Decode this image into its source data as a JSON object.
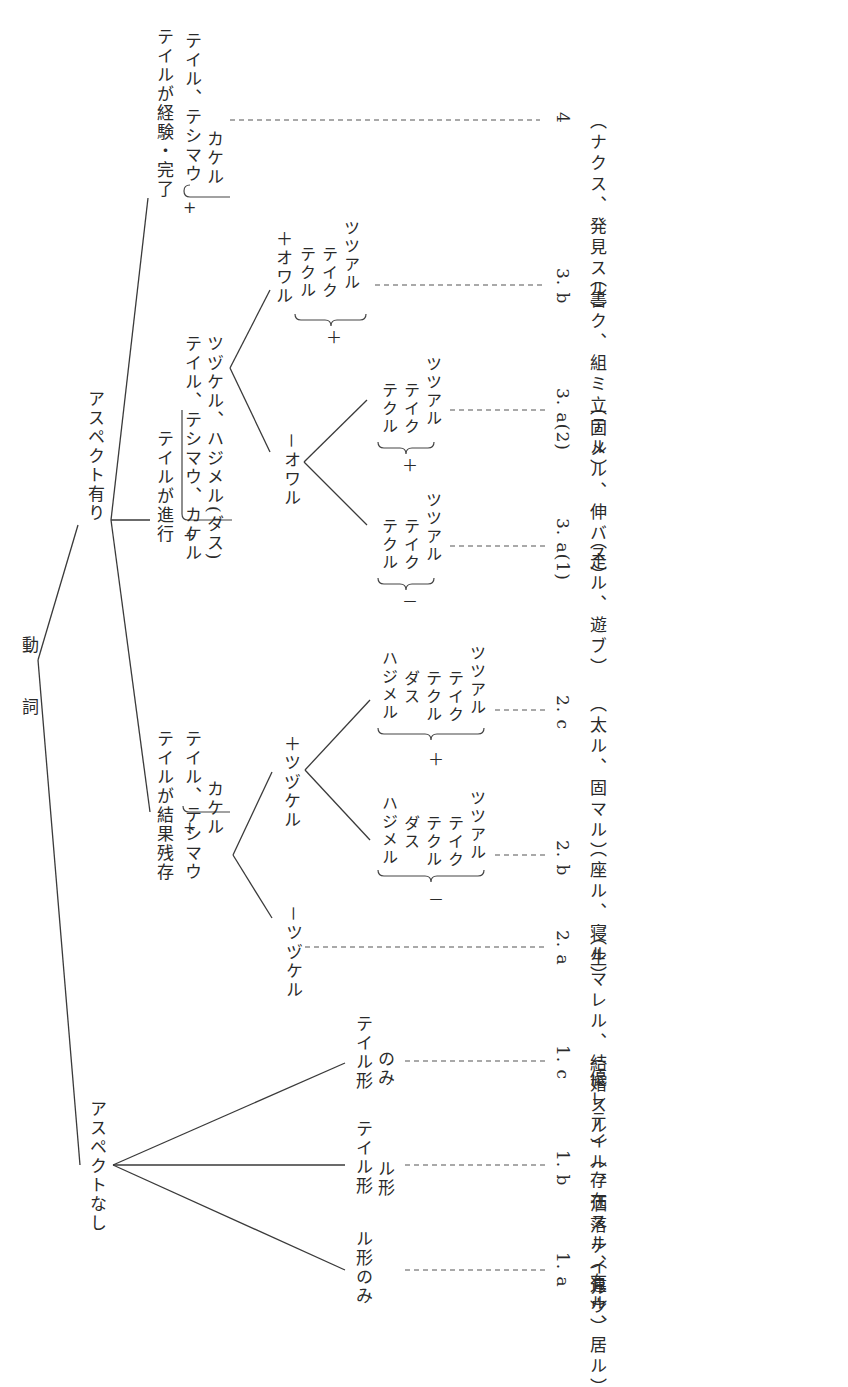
{
  "diagram": {
    "orientation": "rotated 90° clockwise; text reads top-to-bottom",
    "root": "動　詞",
    "aspect_none": {
      "label": "アスペクトなし",
      "children": [
        {
          "label": "ル形のみ",
          "code": "1. a",
          "examples": "（有ル、居ル）"
        },
        {
          "label_line1": "テイル形",
          "label_line2": "ル形",
          "code": "1. b",
          "examples": "（存在スル、違ウ）"
        },
        {
          "label_line1": "テイル形",
          "label_line2": "のみ",
          "code": "1. c",
          "examples": "（優レテイル、洒落テイル）"
        }
      ]
    },
    "aspect_present": {
      "label": "アスペクト有り",
      "result_state": {
        "sign": "+",
        "title": "テイルが結果残存",
        "forms_line1": "テイル、テシマウ",
        "forms_line2": "カケル",
        "minus_tsuzukeru": {
          "label": "－ツヅケル",
          "code": "2. a",
          "examples": "（生マレル、結婚スル）"
        },
        "plus_tsuzukeru": {
          "label": "＋ツヅケル",
          "minus_group": {
            "sign": "－",
            "items": [
              "ハジメル",
              "ダス",
              "テクル",
              "テイク",
              "ツツアル"
            ],
            "code": "2. b",
            "examples": "（座ル、寝ル）"
          },
          "plus_group": {
            "sign": "＋",
            "items": [
              "ハジメル",
              "ダス",
              "テクル",
              "テイク",
              "ツツアル"
            ],
            "code": "2. c",
            "examples": "（太ル、固マル）"
          }
        }
      },
      "progressive": {
        "sign": "+",
        "title": "テイルが進行",
        "forms_line1": "テイル、テシマウ、カケル",
        "forms_line2": "ツヅケル、ハジメル(ダス)",
        "minus_owaru": {
          "label": "－オワル",
          "minus_group": {
            "sign": "－",
            "items": [
              "テクル",
              "テイク",
              "ツツアル"
            ],
            "code": "3. a(1)",
            "examples": "（走ル、遊ブ）"
          },
          "plus_group": {
            "sign": "＋",
            "items": [
              "テクル",
              "テイク",
              "ツツアル"
            ],
            "code": "3. a(2)",
            "examples": "（固メル、伸バス）"
          }
        },
        "plus_owaru": {
          "label": "＋オワル",
          "group": {
            "sign": "＋",
            "items": [
              "テクル",
              "テイク",
              "ツツアル"
            ],
            "code": "3. b",
            "examples": "（書ク、組ミ立テル）"
          }
        }
      },
      "experience": {
        "sign": "+",
        "title": "テイルが経験・完了",
        "forms_line1": "テイル、テシマウ",
        "forms_line2": "カケル",
        "code": "4",
        "examples": "（ナクス、発見スル）"
      }
    }
  },
  "colors": {
    "ink": "#2a2a2a",
    "background": "#ffffff"
  }
}
